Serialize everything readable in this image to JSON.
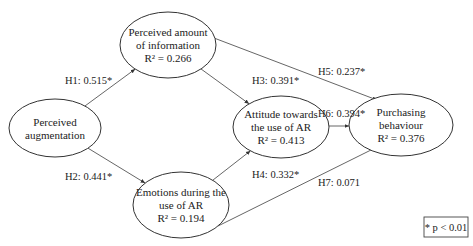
{
  "diagram": {
    "nodes": [
      {
        "id": "aug",
        "lines": [
          "Perceived",
          "augmentation"
        ],
        "r2": ""
      },
      {
        "id": "info",
        "lines": [
          "Perceived amount",
          "of information"
        ],
        "r2": "R² = 0.266"
      },
      {
        "id": "emo",
        "lines": [
          "Emotions during the",
          "use of AR"
        ],
        "r2": "R² = 0.194"
      },
      {
        "id": "att",
        "lines": [
          "Attitude towards",
          "the use of AR"
        ],
        "r2": "R² = 0.413"
      },
      {
        "id": "pur",
        "lines": [
          "Purchasing",
          "behaviour"
        ],
        "r2": "R² = 0.376"
      }
    ],
    "edges": [
      {
        "from": "aug",
        "to": "info",
        "label": "H1: 0.515*"
      },
      {
        "from": "aug",
        "to": "emo",
        "label": "H2: 0.441*"
      },
      {
        "from": "info",
        "to": "att",
        "label": "H3: 0.391*"
      },
      {
        "from": "emo",
        "to": "att",
        "label": "H4: 0.332*"
      },
      {
        "from": "info",
        "to": "pur",
        "label": "H5: 0.237*"
      },
      {
        "from": "att",
        "to": "pur",
        "label": "H6: 0.394*"
      },
      {
        "from": "emo",
        "to": "pur",
        "label": "H7: 0.071"
      }
    ],
    "legend": "* p < 0.01"
  }
}
